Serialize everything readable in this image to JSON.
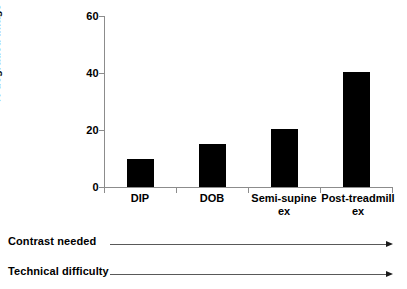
{
  "chart_data": {
    "type": "bar",
    "title": "",
    "xlabel": "",
    "ylabel": "% degraded image quality",
    "categories": [
      "DIP",
      "DOB",
      "Semi-supine\nex",
      "Post-treadmill\nex"
    ],
    "values": [
      10,
      15,
      20.5,
      40.5
    ],
    "ylim": [
      0,
      60
    ],
    "yticks": [
      0,
      20,
      40,
      60
    ],
    "ytick_labels": [
      "0",
      "20",
      "40",
      "60"
    ],
    "grid": false,
    "legend": false,
    "bar_color": "#000000",
    "axis_color": "#8c8c8c"
  },
  "annotations": [
    {
      "label": "Contrast needed",
      "arrow": "right-arrow"
    },
    {
      "label": "Technical difficulty",
      "arrow": "right-arrow"
    }
  ]
}
